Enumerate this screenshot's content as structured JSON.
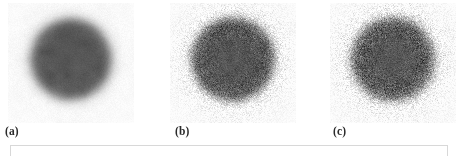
{
  "figure": {
    "background_color": "#ffffff",
    "panel_count": 3,
    "subcaptions": [
      {
        "label": "(a)"
      },
      {
        "label": "(b)"
      },
      {
        "label": "(c)"
      }
    ],
    "caption_box": {
      "text": "",
      "border_color": "#d8d8d8"
    }
  },
  "chart_data": {
    "type": "heatmap",
    "title": "",
    "xlabel": "",
    "ylabel": "",
    "grid": false,
    "legend_position": "none",
    "colormap": "grayscale",
    "value_range": [
      0,
      255
    ],
    "panel_size_px": [
      126,
      120
    ],
    "panels": [
      {
        "id": "a",
        "label": "(a)",
        "disc_center": [
          0.5,
          0.47
        ],
        "disc_radius_frac": 0.335,
        "disc_gray": 86,
        "background_gray": 250,
        "edge_blur_frac": 0.085,
        "noise_sigma": 4,
        "noise_type": "smooth",
        "note": "blurred disc, essentially noise-free smooth edge"
      },
      {
        "id": "b",
        "label": "(b)",
        "disc_center": [
          0.5,
          0.47
        ],
        "disc_radius_frac": 0.345,
        "disc_gray": 86,
        "background_gray": 250,
        "edge_blur_frac": 0.075,
        "noise_sigma": 34,
        "noise_type": "speckle",
        "note": "disc with moderate additive grain, speckled boundary"
      },
      {
        "id": "c",
        "label": "(c)",
        "disc_center": [
          0.5,
          0.47
        ],
        "disc_radius_frac": 0.345,
        "disc_gray": 88,
        "background_gray": 250,
        "edge_blur_frac": 0.08,
        "noise_sigma": 40,
        "noise_type": "speckle",
        "note": "disc with heavier additive grain, broader noisy halo"
      }
    ]
  }
}
